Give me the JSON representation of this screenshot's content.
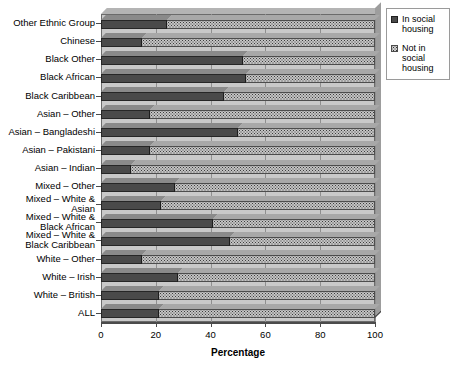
{
  "chart_data": {
    "type": "bar",
    "orientation": "horizontal",
    "stacked": true,
    "title": "",
    "xlabel": "Percentage",
    "ylabel": "",
    "xlim": [
      0,
      100
    ],
    "xticks": [
      0,
      20,
      40,
      60,
      80,
      100
    ],
    "grid": "vertical",
    "legend_position": "top-right",
    "categories": [
      "ALL",
      "White – British",
      "White – Irish",
      "White – Other",
      "Mixed – White & Black Caribbean",
      "Mixed – White & Black African",
      "Mixed – White & Asian",
      "Mixed – Other",
      "Asian – Indian",
      "Asian – Pakistani",
      "Asian – Bangladeshi",
      "Asian – Other",
      "Black Caribbean",
      "Black African",
      "Black Other",
      "Chinese",
      "Other Ethnic Group"
    ],
    "series": [
      {
        "name": "In social housing",
        "color": "#4a4a4a",
        "values": [
          21,
          21,
          28,
          15,
          47,
          41,
          22,
          27,
          11,
          18,
          50,
          18,
          45,
          53,
          52,
          15,
          24
        ]
      },
      {
        "name": "Not in social housing",
        "color": "#c4c4c4",
        "values": [
          79,
          79,
          72,
          85,
          53,
          59,
          78,
          73,
          89,
          82,
          50,
          82,
          55,
          47,
          48,
          85,
          76
        ]
      }
    ]
  },
  "legend": {
    "items": [
      {
        "label": "In social housing",
        "swatch": "dark"
      },
      {
        "label": "Not in social housing",
        "swatch": "light"
      }
    ]
  },
  "axis": {
    "x_title": "Percentage",
    "x_tick_labels": [
      "0",
      "20",
      "40",
      "60",
      "80",
      "100"
    ]
  },
  "y_axis_labels": [
    {
      "lines": [
        "Other Ethnic Group"
      ]
    },
    {
      "lines": [
        "Chinese"
      ]
    },
    {
      "lines": [
        "Black Other"
      ]
    },
    {
      "lines": [
        "Black African"
      ]
    },
    {
      "lines": [
        "Black Caribbean"
      ]
    },
    {
      "lines": [
        "Asian – Other"
      ]
    },
    {
      "lines": [
        "Asian – Bangladeshi"
      ]
    },
    {
      "lines": [
        "Asian – Pakistani"
      ]
    },
    {
      "lines": [
        "Asian – Indian"
      ]
    },
    {
      "lines": [
        "Mixed – Other"
      ]
    },
    {
      "lines": [
        "Mixed – White &",
        "Asian"
      ]
    },
    {
      "lines": [
        "Mixed – White &",
        "Black African"
      ]
    },
    {
      "lines": [
        "Mixed – White &",
        "Black Caribbean"
      ]
    },
    {
      "lines": [
        "White – Other"
      ]
    },
    {
      "lines": [
        "White – Irish"
      ]
    },
    {
      "lines": [
        "White – British"
      ]
    },
    {
      "lines": [
        "ALL"
      ]
    }
  ]
}
